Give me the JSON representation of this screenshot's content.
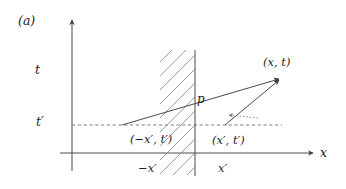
{
  "figure": {
    "panel_label": "(a)",
    "caption_type": "minkowski-spacetime-diagram",
    "background_color": "#ffffff",
    "line_color": "#4a4a4a",
    "text_color": "#1d1d1d"
  },
  "axes": {
    "t_axis_label": "t",
    "x_axis_label": "x",
    "t_prime_label": "t′",
    "origin_px": [
      72,
      153
    ],
    "x_axis_range_px": [
      60,
      315
    ],
    "t_axis_range_px": [
      170,
      18
    ]
  },
  "barrier": {
    "name": "reflecting-wall",
    "label": "p",
    "x_position_px": 195,
    "top_px": 50,
    "bottom_px": 175,
    "hatch_side": "left",
    "hatch_angle_deg": 45
  },
  "points": [
    {
      "id": "source",
      "label": "(−x′, t′)",
      "label_parts": {
        "open": "(",
        "coord1": "−x′",
        "comma": ",",
        "coord2": "t′",
        "close": ")"
      },
      "px": [
        122,
        125
      ]
    },
    {
      "id": "image",
      "label": "(x′, t′)",
      "label_parts": {
        "open": "(",
        "coord1": "x′",
        "comma": ",",
        "coord2": "t′",
        "close": ")"
      },
      "px": [
        225,
        125
      ]
    },
    {
      "id": "observer",
      "label": "(x, t)",
      "label_parts": {
        "open": "(",
        "coord1": "x",
        "comma": ",",
        "coord2": "t",
        "close": ")"
      },
      "px": [
        281,
        77
      ]
    }
  ],
  "tick_labels": {
    "minus_x_prime": "−x′",
    "x_prime": "x′"
  },
  "paths": [
    {
      "id": "direct-ray",
      "from": "source",
      "to": "observer",
      "style": "solid-arrow",
      "description": "arrow from (−x′, t′) through the barrier to (x, t)"
    },
    {
      "id": "image-ray",
      "from": "image",
      "to": "observer",
      "style": "solid-arrow",
      "description": "arrow from (x′, t′) to (x, t)"
    },
    {
      "id": "reflection-hint",
      "from": "image",
      "to": "barrier",
      "style": "dotted-arrow",
      "description": "short dotted arrow pointing back toward the wall at p"
    }
  ],
  "dashed_line": {
    "id": "t-prime-level",
    "y_px": 125,
    "from_x_px": 72,
    "to_x_px": 282,
    "style": "dashed"
  }
}
